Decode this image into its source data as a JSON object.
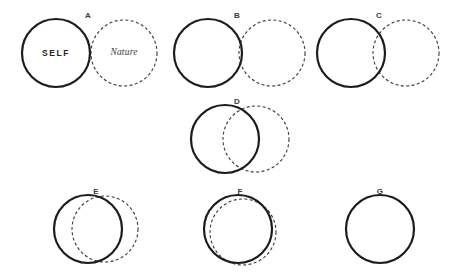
{
  "figure": {
    "background_color": "#ffffff",
    "solid_stroke_color": "#1c1c1c",
    "dashed_stroke_color": "#3a3a3a",
    "solid_stroke_width": 2.2,
    "dashed_stroke_width": 1.1,
    "dash_pattern": "3,2.4"
  },
  "labels": {
    "self": "SELF",
    "nature": "Nature"
  },
  "items": [
    {
      "id": "A",
      "label": "A",
      "label_x": 88,
      "label_y": 11,
      "solid": {
        "cx": 56,
        "cy": 53,
        "r": 34
      },
      "dashed": {
        "cx": 124,
        "cy": 53,
        "r": 33
      },
      "overlap": "tangent",
      "self_text_x": 56,
      "self_text_y": 53,
      "nature_text_x": 124,
      "nature_text_y": 53,
      "show_self_text": true,
      "show_nature_text": true
    },
    {
      "id": "B",
      "label": "B",
      "label_x": 237,
      "label_y": 11,
      "solid": {
        "cx": 208,
        "cy": 53,
        "r": 34
      },
      "dashed": {
        "cx": 272,
        "cy": 53,
        "r": 33
      },
      "overlap": "slight",
      "show_self_text": false,
      "show_nature_text": false
    },
    {
      "id": "C",
      "label": "C",
      "label_x": 379,
      "label_y": 11,
      "solid": {
        "cx": 351,
        "cy": 53,
        "r": 34
      },
      "dashed": {
        "cx": 406,
        "cy": 53,
        "r": 33
      },
      "overlap": "small",
      "show_self_text": false,
      "show_nature_text": false
    },
    {
      "id": "D",
      "label": "D",
      "label_x": 237,
      "label_y": 97,
      "solid": {
        "cx": 225,
        "cy": 139,
        "r": 34
      },
      "dashed": {
        "cx": 256,
        "cy": 139,
        "r": 33
      },
      "overlap": "moderate",
      "show_self_text": false,
      "show_nature_text": false
    },
    {
      "id": "E",
      "label": "E",
      "label_x": 96,
      "label_y": 187,
      "solid": {
        "cx": 88,
        "cy": 229,
        "r": 34
      },
      "dashed": {
        "cx": 105,
        "cy": 229,
        "r": 33
      },
      "overlap": "large",
      "show_self_text": false,
      "show_nature_text": false
    },
    {
      "id": "F",
      "label": "F",
      "label_x": 240,
      "label_y": 187,
      "solid": {
        "cx": 238,
        "cy": 229,
        "r": 34
      },
      "dashed": {
        "cx": 243,
        "cy": 232,
        "r": 33
      },
      "overlap": "near-complete",
      "show_self_text": false,
      "show_nature_text": false
    },
    {
      "id": "G",
      "label": "G",
      "label_x": 380,
      "label_y": 187,
      "solid": {
        "cx": 380,
        "cy": 229,
        "r": 34
      },
      "dashed": null,
      "overlap": "complete",
      "show_self_text": false,
      "show_nature_text": false
    }
  ]
}
